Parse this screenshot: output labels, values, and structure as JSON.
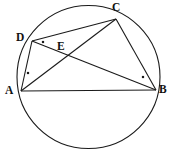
{
  "figure": {
    "kind": "circle-geometry-diagram",
    "canvas": {
      "width": 174,
      "height": 156
    },
    "stroke_color": "#1a1a1a",
    "fill_color": "none",
    "background_color": "#ffffff",
    "circle": {
      "name": "circumcircle",
      "center_x": 88.5,
      "center_y": 77,
      "radius": 71.5,
      "stroke_width": 1.1
    },
    "points": [
      {
        "id": "A",
        "label": "A",
        "x": 21,
        "y": 91,
        "label_x": 5,
        "label_y": 85
      },
      {
        "id": "B",
        "label": "B",
        "x": 156,
        "y": 90,
        "label_x": 159,
        "label_y": 84
      },
      {
        "id": "C",
        "label": "C",
        "x": 116,
        "y": 19,
        "label_x": 112,
        "label_y": 2
      },
      {
        "id": "D",
        "label": "D",
        "x": 32,
        "y": 41,
        "label_x": 16,
        "label_y": 32
      },
      {
        "id": "E",
        "label": "E",
        "x": 63,
        "y": 56,
        "label_x": 57,
        "label_y": 41
      }
    ],
    "segments": [
      {
        "id": "AB",
        "from": "A",
        "to": "B",
        "x1": 21,
        "y1": 91,
        "x2": 156,
        "y2": 90
      },
      {
        "id": "AC",
        "from": "A",
        "to": "C",
        "x1": 21,
        "y1": 91,
        "x2": 116,
        "y2": 19
      },
      {
        "id": "AD",
        "from": "A",
        "to": "D",
        "x1": 21,
        "y1": 91,
        "x2": 32,
        "y2": 41
      },
      {
        "id": "DC",
        "from": "D",
        "to": "C",
        "x1": 32,
        "y1": 41,
        "x2": 116,
        "y2": 19
      },
      {
        "id": "DB",
        "from": "D",
        "to": "B",
        "x1": 32,
        "y1": 41,
        "x2": 156,
        "y2": 90
      },
      {
        "id": "CB",
        "from": "C",
        "to": "B",
        "x1": 116,
        "y1": 19,
        "x2": 156,
        "y2": 90
      }
    ],
    "angle_marks": [
      {
        "id": "mark-at-D",
        "at": "D",
        "x": 43,
        "y": 42,
        "size": 2.2
      },
      {
        "id": "mark-at-A",
        "at": "A",
        "x": 28,
        "y": 73,
        "size": 2.2
      },
      {
        "id": "mark-at-B",
        "at": "B",
        "x": 143,
        "y": 77,
        "size": 2.2
      }
    ]
  }
}
